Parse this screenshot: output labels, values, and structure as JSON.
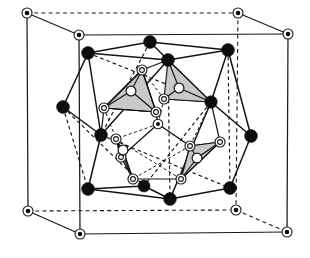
{
  "figure": {
    "caption": "",
    "background_color": "#ffffff",
    "line_color": "#141414",
    "fill_shaded": "#c9c9c9",
    "fill_open": "#ffffff",
    "width": 310,
    "height": 258
  },
  "legend": {
    "marker_types": [
      {
        "name": "corner-atom",
        "style": "small filled dot inside thin ring",
        "label": ""
      },
      {
        "name": "cage-atom",
        "style": "large solid black disc",
        "label": ""
      },
      {
        "name": "cluster-atom",
        "style": "double concentric open ring",
        "label": ""
      },
      {
        "name": "interstitial-atom",
        "style": "single open circle",
        "label": ""
      }
    ]
  },
  "unit_cell": {
    "name": "cubic-unit-cell",
    "corners": [
      {
        "id": "c-front-top-left",
        "x": 27,
        "y": 13
      },
      {
        "id": "c-back-top-left",
        "x": 79,
        "y": 35
      },
      {
        "id": "c-back-top-right",
        "x": 238,
        "y": 13
      },
      {
        "id": "c-front-top-right",
        "x": 288,
        "y": 34
      },
      {
        "id": "c-front-bot-left",
        "x": 28,
        "y": 211
      },
      {
        "id": "c-back-bot-left",
        "x": 80,
        "y": 234
      },
      {
        "id": "c-back-bot-right",
        "x": 236,
        "y": 210
      },
      {
        "id": "c-front-bot-right",
        "x": 287,
        "y": 232
      }
    ],
    "solid_edges": [
      [
        "c-front-top-left",
        "c-back-top-left"
      ],
      [
        "c-back-top-left",
        "c-back-top-right"
      ],
      [
        "c-back-top-right",
        "c-front-top-right"
      ],
      [
        "c-front-top-left",
        "c-front-bot-left"
      ],
      [
        "c-back-top-left",
        "c-back-bot-left"
      ],
      [
        "c-front-top-right",
        "c-front-bot-right"
      ],
      [
        "c-front-bot-left",
        "c-back-bot-left"
      ],
      [
        "c-back-bot-left",
        "c-back-bot-right"
      ],
      [
        "c-back-bot-right",
        "c-front-bot-right"
      ]
    ],
    "dashed_edges": [
      [
        "c-front-top-left",
        "c-front-top-right"
      ],
      [
        "c-back-top-right",
        "c-back-bot-right"
      ],
      [
        "c-front-bot-left",
        "c-front-bot-right"
      ],
      [
        "c-front-top-right",
        "c-back-top-right"
      ]
    ]
  },
  "cage": {
    "name": "outer-polyhedron",
    "atom_radius": 6.2,
    "atoms": [
      {
        "id": "p1",
        "x": 150,
        "y": 42
      },
      {
        "id": "p2",
        "x": 88,
        "y": 53
      },
      {
        "id": "p3",
        "x": 228,
        "y": 50
      },
      {
        "id": "p4",
        "x": 168,
        "y": 60
      },
      {
        "id": "p5",
        "x": 63,
        "y": 107
      },
      {
        "id": "p6",
        "x": 211,
        "y": 102
      },
      {
        "id": "p7",
        "x": 101,
        "y": 135
      },
      {
        "id": "p8",
        "x": 251,
        "y": 136
      },
      {
        "id": "p9",
        "x": 88,
        "y": 189
      },
      {
        "id": "p10",
        "x": 144,
        "y": 186
      },
      {
        "id": "p11",
        "x": 230,
        "y": 188
      },
      {
        "id": "p12",
        "x": 170,
        "y": 199
      }
    ],
    "solid_edges": [
      [
        "p2",
        "p1"
      ],
      [
        "p1",
        "p4"
      ],
      [
        "p4",
        "p3"
      ],
      [
        "p3",
        "p1"
      ],
      [
        "p2",
        "p4"
      ],
      [
        "p2",
        "p5"
      ],
      [
        "p5",
        "p7"
      ],
      [
        "p7",
        "p9"
      ],
      [
        "p9",
        "p10"
      ],
      [
        "p10",
        "p12"
      ],
      [
        "p12",
        "p11"
      ],
      [
        "p11",
        "p8"
      ],
      [
        "p8",
        "p6"
      ],
      [
        "p6",
        "p3"
      ],
      [
        "p2",
        "p7"
      ],
      [
        "p7",
        "p4"
      ],
      [
        "p4",
        "p6"
      ],
      [
        "p6",
        "p12"
      ],
      [
        "p3",
        "p8"
      ],
      [
        "p9",
        "p12"
      ]
    ],
    "dashed_edges": [
      [
        "p2",
        "p6"
      ],
      [
        "p5",
        "p10"
      ],
      [
        "p1",
        "p7"
      ],
      [
        "p3",
        "p11"
      ],
      [
        "p7",
        "p11"
      ],
      [
        "p5",
        "p9"
      ],
      [
        "p6",
        "p10"
      ],
      [
        "p4",
        "p10"
      ]
    ]
  },
  "cluster": {
    "name": "inner-cluster",
    "ring_atom_radius_outer": 5.0,
    "ring_atom_radius_inner": 2.4,
    "plain_atom_radius": 4.6,
    "ring_atoms": [
      {
        "id": "r1",
        "x": 142,
        "y": 70
      },
      {
        "id": "r2",
        "x": 104,
        "y": 108
      },
      {
        "id": "r3",
        "x": 156,
        "y": 112
      },
      {
        "id": "r4",
        "x": 164,
        "y": 99
      },
      {
        "id": "r5",
        "x": 211,
        "y": 102
      },
      {
        "id": "r6",
        "x": 116,
        "y": 139
      },
      {
        "id": "r7",
        "x": 133,
        "y": 179
      },
      {
        "id": "r8",
        "x": 121,
        "y": 157
      },
      {
        "id": "r9",
        "x": 190,
        "y": 146
      },
      {
        "id": "r10",
        "x": 220,
        "y": 142
      },
      {
        "id": "r11",
        "x": 181,
        "y": 179
      },
      {
        "id": "r12",
        "x": 158,
        "y": 124
      }
    ],
    "plain_atoms": [
      {
        "id": "o1",
        "x": 131,
        "y": 91
      },
      {
        "id": "o2",
        "x": 179,
        "y": 88
      },
      {
        "id": "o3",
        "x": 197,
        "y": 158
      },
      {
        "id": "o4",
        "x": 123,
        "y": 150
      }
    ],
    "shaded_triangles": [
      {
        "id": "tri-upper-left",
        "points": "142,70 104,108 156,112",
        "fill": "#c9c9c9"
      },
      {
        "id": "tri-upper-right",
        "points": "168,60 211,102 164,99",
        "fill": "#c9c9c9"
      },
      {
        "id": "tri-lower-right",
        "points": "190,146 220,142 181,179",
        "fill": "#c9c9c9"
      },
      {
        "id": "tri-lower-left",
        "points": "116,139 133,179 121,157",
        "fill": "#c9c9c9"
      }
    ],
    "cube_frame_solid": [
      [
        "r1",
        "r4"
      ],
      [
        "r4",
        "r5"
      ],
      [
        "r2",
        "r12"
      ],
      [
        "r12",
        "r3"
      ],
      [
        "r6",
        "r8"
      ],
      [
        "r8",
        "r7"
      ],
      [
        "r9",
        "r10"
      ],
      [
        "r10",
        "r11"
      ],
      [
        "r1",
        "r2"
      ],
      [
        "r3",
        "r9"
      ],
      [
        "r5",
        "r10"
      ],
      [
        "r7",
        "r11"
      ]
    ],
    "cube_frame_dashed": [
      [
        "r1",
        "r12"
      ],
      [
        "r4",
        "r12"
      ],
      [
        "r12",
        "r6"
      ],
      [
        "r12",
        "r9"
      ],
      [
        "r2",
        "r6"
      ],
      [
        "r5",
        "r9"
      ],
      [
        "r6",
        "r11"
      ],
      [
        "r9",
        "r7"
      ]
    ],
    "center_atom": {
      "id": "center",
      "x": 158,
      "y": 124
    }
  }
}
